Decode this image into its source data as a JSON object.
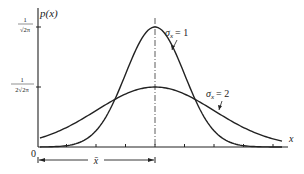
{
  "chart_data": {
    "type": "line",
    "title": "",
    "xlabel": "x",
    "ylabel": "p(x)",
    "origin_label": "0",
    "mean_label": "x̄",
    "x_ticks_count": 9,
    "y_ticks": [
      {
        "label_num": "1",
        "label_den": "√2π",
        "value": 0.3989
      },
      {
        "label_num": "1",
        "label_den": "2√2π",
        "value": 0.1995
      }
    ],
    "series": [
      {
        "name": "σx = 1",
        "sigma": 1,
        "peak": 0.3989
      },
      {
        "name": "σx = 2",
        "sigma": 2,
        "peak": 0.1995
      }
    ],
    "annotations": [
      "σx = 1",
      "σx = 2",
      "x̄ (distance from 0 to mean)"
    ],
    "grid": false
  },
  "labels": {
    "ylabel": "p(x)",
    "xlabel": "x",
    "origin": "0",
    "mean": "x̄",
    "ytick1_num": "1",
    "ytick1_den": "√2π",
    "ytick2_num": "1",
    "ytick2_den": "2√2π",
    "sigma1": "= 1",
    "sigma2": "= 2",
    "sigma_sym": "σ",
    "sigma_sub": "x"
  }
}
